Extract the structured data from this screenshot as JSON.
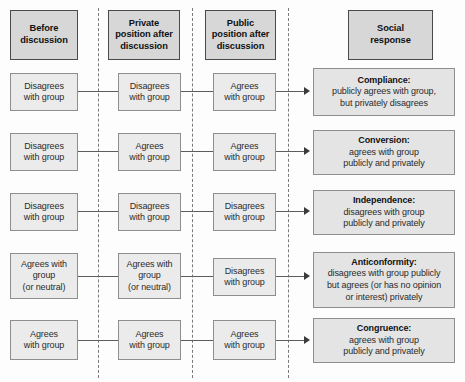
{
  "headers": [
    {
      "label": "Before\ndiscussion",
      "name": "header-before-discussion"
    },
    {
      "label": "Private\nposition after\ndiscussion",
      "name": "header-private-position"
    },
    {
      "label": "Public\nposition after\ndiscussion",
      "name": "header-public-position"
    },
    {
      "label": "Social\nresponse",
      "name": "header-social-response"
    }
  ],
  "rows": [
    {
      "before": "Disagrees\nwith group",
      "private": "Disagrees\nwith group",
      "public": "Agrees\nwith group",
      "response_title": "Compliance:",
      "response_body": "publicly agrees with group,\nbut privately disagrees"
    },
    {
      "before": "Disagrees\nwith group",
      "private": "Agrees\nwith group",
      "public": "Agrees\nwith group",
      "response_title": "Conversion:",
      "response_body": "agrees with group\npublicly and privately"
    },
    {
      "before": "Disagrees\nwith group",
      "private": "Disagrees\nwith group",
      "public": "Disagrees\nwith group",
      "response_title": "Independence:",
      "response_body": "disagrees with group\npublicly and privately"
    },
    {
      "before": "Agrees with\ngroup\n(or neutral)",
      "private": "Agrees with\ngroup\n(or neutral)",
      "public": "Disagrees\nwith group",
      "response_title": "Anticonformity:",
      "response_body": "disagrees with group publicly\nbut agrees (or has no opinion\nor interest) privately"
    },
    {
      "before": "Agrees\nwith group",
      "private": "Agrees\nwith group",
      "public": "Agrees\nwith group",
      "response_title": "Congruence:",
      "response_body": "agrees with group\npublicly and privately"
    }
  ],
  "colors": {
    "header_fill": "#d7d7d7",
    "header_border": "#4a4a4a",
    "cell_fill": "#ebebeb",
    "response_fill": "#e4e4e4",
    "cell_border": "#8e8e8e",
    "divider": "#7a7a7a",
    "connector": "#5d5d5d",
    "background": "#fdfdfd"
  }
}
